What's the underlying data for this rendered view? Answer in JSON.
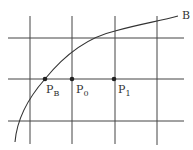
{
  "diagram": {
    "curve_label": "B",
    "points": [
      {
        "name": "P",
        "sub": "B"
      },
      {
        "name": "P",
        "sub": "0"
      },
      {
        "name": "P",
        "sub": "1"
      }
    ],
    "colors": {
      "line": "#3a3a3a",
      "point": "#222222"
    }
  }
}
